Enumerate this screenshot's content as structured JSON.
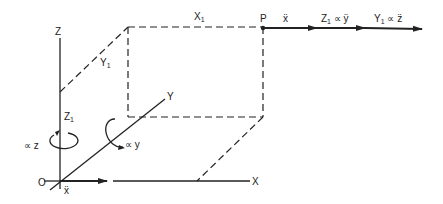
{
  "diagram": {
    "axes": {
      "z_label": "Z",
      "y_label": "Y",
      "x_label": "X",
      "origin_label": "O"
    },
    "dimensions": {
      "x1_label": "X",
      "x1_sub": "1",
      "y1_label": "Y",
      "y1_sub": "1",
      "z1_label": "Z",
      "z1_sub": "1"
    },
    "point_label": "P",
    "vectors": {
      "accel_at_origin": "ẍ",
      "accel_at_p": "ẍ",
      "z1_term_main": "Z",
      "z1_term_sub": "1",
      "z1_term_rest": " ∝ ÿ",
      "y1_term_main": "Y",
      "y1_term_sub": "1",
      "y1_term_rest": " ∝ z̈"
    },
    "rotations": {
      "about_z": "∝ z",
      "about_y": "∝ y"
    }
  }
}
